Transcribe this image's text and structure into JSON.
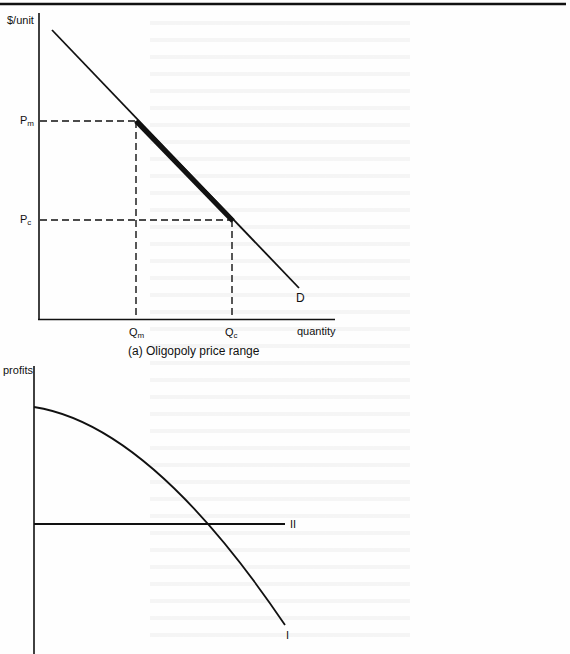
{
  "figure": {
    "panel_a": {
      "y_axis_label": "$/unit",
      "x_axis_label": "quantity",
      "curve_label": "D",
      "price_labels": [
        {
          "main": "P",
          "sub": "m"
        },
        {
          "main": "P",
          "sub": "c"
        }
      ],
      "quantity_labels": [
        {
          "main": "Q",
          "sub": "m"
        },
        {
          "main": "Q",
          "sub": "c"
        }
      ],
      "caption": "(a)  Oligopoly price range",
      "highlight": "thick segment of D between (Qm, Pm) and (Qc, Pc)"
    },
    "panel_b": {
      "y_axis_label": "profits",
      "curve_labels": [
        "I",
        "II"
      ]
    }
  },
  "colors": {
    "ink": "#111111",
    "paper": "#fefefe"
  }
}
